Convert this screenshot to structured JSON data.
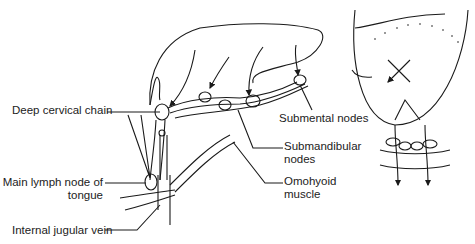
{
  "figure": {
    "labels": {
      "deep_cervical_chain": "Deep cervical chain",
      "submental_nodes": "Submental nodes",
      "submandibular_nodes_1": "Submandibular",
      "submandibular_nodes_2": "nodes",
      "main_lymph_node_1": "Main lymph node of",
      "main_lymph_node_2": "tongue",
      "omohyoid_1": "Omohyoid",
      "omohyoid_2": "muscle",
      "internal_jugular_vein": "Internal jugular vein"
    },
    "colors": {
      "ink": "#1a1a1a",
      "background": "#ffffff"
    }
  }
}
